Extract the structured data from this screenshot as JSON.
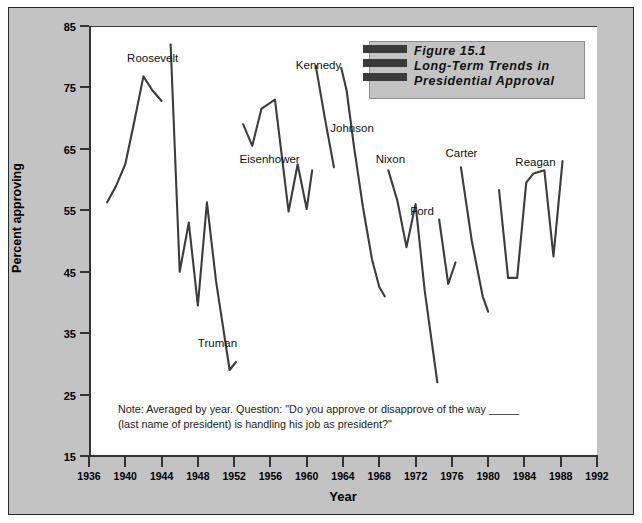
{
  "figure": {
    "title_lines": [
      "Figure 15.1",
      "Long-Term Trends in",
      "Presidential Approval"
    ],
    "note": "Note:  Averaged by year. Question: \"Do you approve or disapprove of the way _____ (last name of president) is handling his job as president?\"",
    "accent_color": "#3a3a3a",
    "panel_background": "#ffffff",
    "plate_background": "#c3c3c3"
  },
  "chart_data": {
    "type": "line",
    "title": "Figure 15.1 Long-Term Trends in Presidential Approval",
    "xlabel": "Year",
    "ylabel": "Percent approving",
    "xlim": [
      1936,
      1992
    ],
    "ylim": [
      15,
      85
    ],
    "xticks": [
      1936,
      1940,
      1944,
      1948,
      1952,
      1956,
      1960,
      1964,
      1968,
      1972,
      1976,
      1980,
      1984,
      1988,
      1992
    ],
    "yticks": [
      15,
      25,
      35,
      45,
      55,
      65,
      75,
      85
    ],
    "grid": false,
    "legend": "none",
    "annotation": "Note:  Averaged by year. Question: \"Do you approve or disapprove of the way _____ (last name of president) is handling his job as president?\"",
    "series": [
      {
        "name": "Roosevelt",
        "label_x": 1940.2,
        "label_y": 79.5,
        "x": [
          1938.0,
          1939.0,
          1940.0,
          1941.0,
          1942.0,
          1943.0,
          1944.0
        ],
        "values": [
          56.3,
          59.0,
          62.5,
          69.5,
          76.8,
          74.5,
          72.8
        ]
      },
      {
        "name": "Truman",
        "label_x": 1948.0,
        "label_y": 33.0,
        "x": [
          1945.0,
          1946.0,
          1947.0,
          1948.0,
          1949.0,
          1950.0,
          1951.5,
          1952.2
        ],
        "values": [
          82.0,
          45.0,
          53.0,
          39.5,
          56.3,
          43.5,
          29.0,
          30.3
        ]
      },
      {
        "name": "Eisenhower",
        "label_x": 1952.6,
        "label_y": 63.0,
        "x": [
          1953.0,
          1954.0,
          1955.0,
          1956.5,
          1958.0,
          1959.0,
          1960.0,
          1960.6
        ],
        "values": [
          69.0,
          65.5,
          71.5,
          73.0,
          54.8,
          62.5,
          55.2,
          61.5
        ]
      },
      {
        "name": "Kennedy",
        "label_x": 1958.8,
        "label_y": 78.3,
        "x": [
          1961.0,
          1962.0,
          1963.0
        ],
        "values": [
          78.5,
          70.0,
          62.0
        ]
      },
      {
        "name": "Johnson",
        "label_x": 1962.6,
        "label_y": 68.0,
        "x": [
          1963.8,
          1964.4,
          1965.2,
          1966.2,
          1967.2,
          1968.0,
          1968.6
        ],
        "values": [
          78.2,
          74.5,
          65.5,
          55.5,
          47.0,
          42.5,
          41.0
        ]
      },
      {
        "name": "Nixon",
        "label_x": 1967.6,
        "label_y": 63.0,
        "x": [
          1969.0,
          1970.0,
          1971.0,
          1972.0,
          1973.0,
          1974.4
        ],
        "values": [
          61.5,
          56.5,
          49.0,
          56.0,
          42.0,
          27.0
        ]
      },
      {
        "name": "Ford",
        "label_x": 1971.4,
        "label_y": 54.5,
        "x": [
          1974.6,
          1975.6,
          1976.4
        ],
        "values": [
          53.5,
          43.0,
          46.5
        ]
      },
      {
        "name": "Carter",
        "label_x": 1975.3,
        "label_y": 64.0,
        "x": [
          1977.0,
          1978.2,
          1979.4,
          1980.0
        ],
        "values": [
          62.0,
          50.0,
          41.0,
          38.5
        ]
      },
      {
        "name": "Reagan",
        "label_x": 1983.0,
        "label_y": 62.5,
        "x": [
          1981.2,
          1982.2,
          1983.2,
          1984.2,
          1985.0,
          1986.2,
          1987.2,
          1988.2
        ],
        "values": [
          58.3,
          44.0,
          44.0,
          59.5,
          61.0,
          61.5,
          47.5,
          63.0
        ]
      }
    ]
  }
}
